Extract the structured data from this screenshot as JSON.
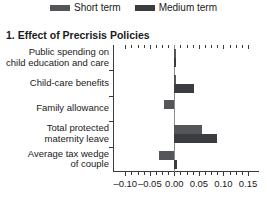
{
  "chart_data": {
    "type": "bar",
    "orientation": "horizontal",
    "title": "1. Effect of Precrisis Policies",
    "xlabel": "",
    "ylabel": "",
    "xlim": [
      -0.125,
      0.1725
    ],
    "grid": false,
    "legend_position": "top-center",
    "xticks": [
      "–0.10",
      "–0.05",
      "0.00",
      "0.05",
      "0.10",
      "0.15"
    ],
    "xtick_values": [
      -0.1,
      -0.05,
      0.0,
      0.05,
      0.1,
      0.15
    ],
    "categories": [
      "Public spending on\nchild education and care",
      "Child-care benefits",
      "Family allowance",
      "Total protected\nmaternity leave",
      "Average tax wedge\nof couple"
    ],
    "series": [
      {
        "name": "Short term",
        "color": "#55565a",
        "values": [
          0.003,
          0.002,
          -0.022,
          0.057,
          -0.031
        ]
      },
      {
        "name": "Medium term",
        "color": "#3b3c40",
        "values": [
          0.004,
          0.04,
          0.0,
          0.086,
          0.005
        ]
      }
    ]
  },
  "legend": {
    "items": [
      {
        "label": "Short term",
        "color": "#55565a"
      },
      {
        "label": "Medium term",
        "color": "#3b3c40"
      }
    ]
  }
}
